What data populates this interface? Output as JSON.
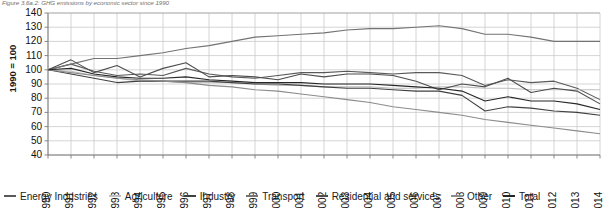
{
  "figure": {
    "caption": "Figure 3.6a.2: GHG emissions by economic sector since 1990",
    "axis_title": "1990 = 100"
  },
  "legend": {
    "items": [
      {
        "label": "Energy Industries",
        "color": "#595959"
      },
      {
        "label": "Agriculture",
        "color": "#bfbfbf"
      },
      {
        "label": "Industry",
        "color": "#404040"
      },
      {
        "label": "Transport",
        "color": "#737373"
      },
      {
        "label": "Residential and services",
        "color": "#4d4d4d"
      },
      {
        "label": "Other",
        "color": "#8c8c8c"
      },
      {
        "label": "Total",
        "color": "#262626"
      }
    ]
  },
  "chart_data": {
    "type": "line",
    "title": "Figure 3.6a.2: GHG emissions by economic sector since 1990",
    "xlabel": "",
    "ylabel": "1990 = 100",
    "ylim": [
      40,
      140
    ],
    "ytick_step": 10,
    "yticks": [
      140,
      130,
      120,
      110,
      100,
      90,
      80,
      70,
      60,
      50,
      40
    ],
    "grid": true,
    "legend_position": "bottom",
    "x": [
      1990,
      1991,
      1992,
      1993,
      1994,
      1995,
      1996,
      1997,
      1998,
      1999,
      2000,
      2001,
      2002,
      2003,
      2004,
      2005,
      2006,
      2007,
      2008,
      2009,
      2010,
      2011,
      2012,
      2013,
      2014
    ],
    "categories": [
      "1990",
      "1991",
      "1992",
      "1993",
      "1994",
      "1995",
      "1996",
      "1997",
      "1998",
      "1999",
      "2000",
      "2001",
      "2002",
      "2003",
      "2004",
      "2005",
      "2006",
      "2007",
      "2008",
      "2009",
      "2010",
      "2011",
      "2012",
      "2013",
      "2014"
    ],
    "series": [
      {
        "name": "Energy Industries",
        "color": "#595959",
        "values": [
          100,
          104,
          99,
          96,
          97,
          96,
          101,
          97,
          95,
          94,
          96,
          98,
          98,
          99,
          98,
          97,
          98,
          98,
          96,
          89,
          93,
          91,
          92,
          87,
          79
        ]
      },
      {
        "name": "Agriculture",
        "color": "#bfbfbf",
        "values": [
          100,
          99,
          96,
          94,
          92,
          92,
          91,
          91,
          91,
          90,
          89,
          89,
          88,
          88,
          88,
          87,
          87,
          88,
          88,
          87,
          87,
          86,
          86,
          86,
          86
        ]
      },
      {
        "name": "Industry",
        "color": "#404040",
        "values": [
          100,
          97,
          94,
          91,
          92,
          92,
          92,
          92,
          91,
          90,
          90,
          89,
          88,
          87,
          87,
          86,
          85,
          85,
          82,
          71,
          74,
          73,
          71,
          70,
          68
        ]
      },
      {
        "name": "Transport",
        "color": "#737373",
        "values": [
          100,
          104,
          108,
          108,
          110,
          112,
          115,
          117,
          120,
          123,
          124,
          125,
          126,
          128,
          129,
          129,
          130,
          131,
          129,
          125,
          125,
          123,
          120,
          120,
          120
        ]
      },
      {
        "name": "Residential and services",
        "color": "#4d4d4d",
        "values": [
          100,
          107,
          98,
          103,
          95,
          101,
          105,
          95,
          96,
          95,
          93,
          97,
          95,
          97,
          97,
          96,
          92,
          86,
          90,
          88,
          94,
          84,
          87,
          85,
          76
        ]
      },
      {
        "name": "Other",
        "color": "#8c8c8c",
        "values": [
          100,
          98,
          96,
          94,
          93,
          92,
          91,
          89,
          88,
          86,
          85,
          83,
          81,
          79,
          77,
          74,
          72,
          70,
          68,
          65,
          63,
          61,
          59,
          57,
          55
        ]
      },
      {
        "name": "Total",
        "color": "#262626",
        "values": [
          100,
          101,
          97,
          95,
          94,
          94,
          95,
          93,
          92,
          91,
          91,
          91,
          90,
          90,
          90,
          89,
          88,
          87,
          85,
          78,
          81,
          78,
          78,
          76,
          72
        ]
      }
    ]
  }
}
